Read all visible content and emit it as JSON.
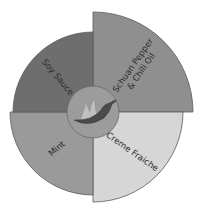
{
  "chart_data": {
    "type": "polar_area",
    "title": "",
    "center_icon": "chili-pepper-flame-icon",
    "categories": [
      "Schuan Pepper & Chili Oil",
      "Creme Fraiche",
      "Mint",
      "Soy Sauce"
    ],
    "values": [
      100,
      90,
      83,
      80
    ],
    "segments": [
      {
        "label_lines": [
          "Schuan Pepper",
          "& Chili Oil"
        ],
        "value": 100,
        "color": "#8f8f8f",
        "quadrant": "top-right"
      },
      {
        "label_lines": [
          "Creme Fraiche"
        ],
        "value": 90,
        "color": "#d6d6d6",
        "quadrant": "bottom-right"
      },
      {
        "label_lines": [
          "Mint"
        ],
        "value": 83,
        "color": "#9a9a9a",
        "quadrant": "bottom-left"
      },
      {
        "label_lines": [
          "Soy Sauce"
        ],
        "value": 80,
        "color": "#6e6e6e",
        "quadrant": "top-left"
      }
    ],
    "inner_circle_color": "#9c9c9c",
    "legend": "none",
    "grid": false
  }
}
